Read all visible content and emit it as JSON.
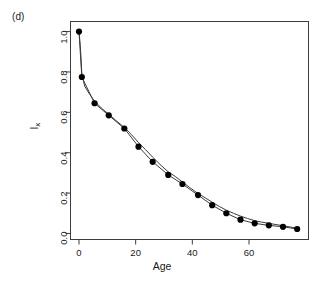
{
  "panel": {
    "tag": "(d)"
  },
  "chart_data": {
    "type": "scatter",
    "title": "",
    "subtitle": "",
    "panel_label": "(d)",
    "xlabel": "Age",
    "ylabel": "lx",
    "ylabel_plain": "l_x",
    "xlim": [
      -3,
      81
    ],
    "ylim": [
      -0.03,
      1.05
    ],
    "xticks": [
      0,
      20,
      40,
      60
    ],
    "xticklabels": [
      "0",
      "20",
      "40",
      "60"
    ],
    "yticks": [
      0.0,
      0.2,
      0.4,
      0.6,
      0.8,
      1.0
    ],
    "yticklabels": [
      "0.0",
      "0.2",
      "0.4",
      "0.6",
      "0.8",
      "1.0"
    ],
    "grid": false,
    "legend": null,
    "series": [
      {
        "name": "lx",
        "marker": "filled-circle",
        "marker_color": "#000000",
        "line": true,
        "line_color": "#3c3c3c",
        "x": [
          0,
          1,
          5.5,
          10.5,
          16,
          21,
          26,
          31.5,
          36.5,
          42,
          47,
          52,
          57,
          62,
          67,
          72,
          77
        ],
        "values": [
          1.0,
          0.775,
          0.645,
          0.585,
          0.52,
          0.43,
          0.355,
          0.29,
          0.245,
          0.19,
          0.14,
          0.1,
          0.068,
          0.05,
          0.04,
          0.033,
          0.022
        ]
      },
      {
        "name": "fitted-curve",
        "marker": "none",
        "line": true,
        "line_color": "#3c3c3c",
        "x": [
          0,
          0.3,
          0.6,
          1.0,
          2.0,
          3.5,
          5.5,
          8.0,
          10.5,
          13.0,
          16.0,
          18.5,
          21.0,
          23.5,
          26.0,
          28.5,
          31.5,
          34.0,
          36.5,
          39.0,
          42.0,
          44.5,
          47.0,
          49.5,
          52.0,
          54.5,
          57.0,
          59.5,
          62.0,
          64.5,
          67.0,
          69.5,
          72.0,
          74.5,
          77.0
        ],
        "values": [
          1.0,
          0.955,
          0.9,
          0.79,
          0.73,
          0.695,
          0.655,
          0.62,
          0.59,
          0.56,
          0.525,
          0.49,
          0.45,
          0.415,
          0.378,
          0.343,
          0.305,
          0.282,
          0.255,
          0.228,
          0.198,
          0.177,
          0.155,
          0.134,
          0.115,
          0.1,
          0.086,
          0.074,
          0.063,
          0.056,
          0.05,
          0.044,
          0.038,
          0.032,
          0.026
        ]
      }
    ]
  },
  "colors": {
    "axis": "#3c3c3c",
    "marker": "#000000",
    "line": "#3c3c3c",
    "text": "#1a1a1a",
    "background": "#ffffff"
  }
}
